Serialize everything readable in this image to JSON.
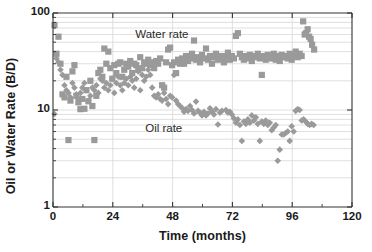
{
  "chart_data": {
    "type": "scatter",
    "title": "",
    "xlabel": "Time (months)",
    "ylabel": "Oil or Water Rate (B/D)",
    "xlim": [
      0,
      120
    ],
    "ylim": [
      1,
      100
    ],
    "yscale": "log",
    "xscale": "linear",
    "grid": "horizontal log-minor gridlines plus vertical major gridlines",
    "legend": "inline annotations inside plot area",
    "xticks": [
      0,
      24,
      48,
      72,
      96,
      120
    ],
    "xtick_labels": [
      "0",
      "24",
      "48",
      "72",
      "96",
      "120"
    ],
    "x_minor_ticks": [
      12,
      36,
      60,
      84,
      108
    ],
    "yticks": [
      1,
      10,
      100
    ],
    "ytick_labels": [
      "1",
      "10",
      "100"
    ],
    "y_minor_ticks": [
      2,
      3,
      4,
      5,
      6,
      7,
      8,
      9,
      20,
      30,
      40,
      50,
      60,
      70,
      80,
      90
    ],
    "annotations": [
      {
        "text": "Water rate",
        "x": 33,
        "y": 60
      },
      {
        "text": "Oil rate",
        "x": 37,
        "y": 6.4
      }
    ],
    "marker_color": "#9a9a9a",
    "axis_color": "#333333",
    "grid_color": "#d8d8d8",
    "series": [
      {
        "name": "Water rate",
        "marker": "square",
        "color": "#9a9a9a",
        "points": [
          [
            0.6,
            75
          ],
          [
            1.4,
            38
          ],
          [
            2.2,
            57
          ],
          [
            3.0,
            30
          ],
          [
            3.8,
            14.5
          ],
          [
            4.6,
            13.5
          ],
          [
            5.4,
            22
          ],
          [
            6.2,
            4.9
          ],
          [
            7.0,
            12.5
          ],
          [
            7.8,
            25
          ],
          [
            8.6,
            29
          ],
          [
            9.4,
            14
          ],
          [
            10.2,
            12
          ],
          [
            11.0,
            10.2
          ],
          [
            11.8,
            13
          ],
          [
            12.6,
            10.3
          ],
          [
            13.4,
            16
          ],
          [
            14.2,
            12.3
          ],
          [
            15.0,
            20
          ],
          [
            15.8,
            11
          ],
          [
            16.6,
            4.9
          ],
          [
            17.4,
            14
          ],
          [
            18.2,
            24
          ],
          [
            19.0,
            26
          ],
          [
            19.8,
            22
          ],
          [
            20.6,
            43
          ],
          [
            21.4,
            30
          ],
          [
            22.2,
            40
          ],
          [
            23.0,
            27
          ],
          [
            23.8,
            21
          ],
          [
            24.6,
            29
          ],
          [
            25.4,
            24
          ],
          [
            26.2,
            30
          ],
          [
            27.0,
            31
          ],
          [
            27.8,
            22
          ],
          [
            28.6,
            26
          ],
          [
            29.4,
            30
          ],
          [
            30.2,
            28
          ],
          [
            31.0,
            32
          ],
          [
            31.8,
            24
          ],
          [
            32.6,
            30
          ],
          [
            33.4,
            29
          ],
          [
            34.2,
            26
          ],
          [
            35.0,
            35
          ],
          [
            35.8,
            27
          ],
          [
            36.6,
            31
          ],
          [
            37.4,
            30
          ],
          [
            38.2,
            33
          ],
          [
            39.0,
            29
          ],
          [
            39.8,
            31
          ],
          [
            40.6,
            27
          ],
          [
            41.4,
            32
          ],
          [
            42.2,
            30
          ],
          [
            43.0,
            34
          ],
          [
            43.8,
            18
          ],
          [
            44.6,
            17
          ],
          [
            45.4,
            31
          ],
          [
            46.2,
            42
          ],
          [
            47.0,
            44
          ],
          [
            47.8,
            29
          ],
          [
            48.6,
            31
          ],
          [
            49.4,
            24
          ],
          [
            50.2,
            33
          ],
          [
            51.0,
            30
          ],
          [
            51.8,
            34
          ],
          [
            52.6,
            30
          ],
          [
            53.4,
            36
          ],
          [
            54.2,
            32
          ],
          [
            55.0,
            34
          ],
          [
            55.8,
            38
          ],
          [
            56.6,
            52
          ],
          [
            57.4,
            33
          ],
          [
            58.2,
            35
          ],
          [
            59.0,
            31
          ],
          [
            59.8,
            37
          ],
          [
            60.6,
            34
          ],
          [
            61.4,
            43
          ],
          [
            62.2,
            33
          ],
          [
            63.0,
            36
          ],
          [
            63.8,
            30
          ],
          [
            64.6,
            35
          ],
          [
            65.4,
            38
          ],
          [
            66.2,
            33
          ],
          [
            67.0,
            36
          ],
          [
            67.8,
            34
          ],
          [
            68.6,
            31
          ],
          [
            69.4,
            36
          ],
          [
            70.2,
            39
          ],
          [
            71.0,
            33
          ],
          [
            71.8,
            36
          ],
          [
            72.6,
            34
          ],
          [
            73.4,
            58
          ],
          [
            74.2,
            62
          ],
          [
            75.0,
            38
          ],
          [
            75.8,
            35
          ],
          [
            76.6,
            33
          ],
          [
            77.4,
            36
          ],
          [
            78.2,
            34
          ],
          [
            79.0,
            37
          ],
          [
            79.8,
            32
          ],
          [
            80.6,
            36
          ],
          [
            81.4,
            35
          ],
          [
            82.2,
            38
          ],
          [
            83.0,
            34
          ],
          [
            83.8,
            23
          ],
          [
            84.6,
            36
          ],
          [
            85.4,
            33
          ],
          [
            86.2,
            37
          ],
          [
            87.0,
            35
          ],
          [
            87.8,
            34
          ],
          [
            88.6,
            38
          ],
          [
            89.4,
            33
          ],
          [
            90.2,
            36
          ],
          [
            91.0,
            32
          ],
          [
            91.8,
            37
          ],
          [
            92.6,
            35
          ],
          [
            93.4,
            36
          ],
          [
            94.2,
            34
          ],
          [
            95.0,
            38
          ],
          [
            95.8,
            33
          ],
          [
            96.6,
            36
          ],
          [
            97.4,
            40
          ],
          [
            98.2,
            35
          ],
          [
            99.0,
            38
          ],
          [
            99.8,
            36
          ],
          [
            100.4,
            82
          ],
          [
            101.0,
            60
          ],
          [
            101.6,
            62
          ],
          [
            102.2,
            68
          ],
          [
            102.8,
            57
          ],
          [
            103.4,
            54
          ],
          [
            104.0,
            47
          ],
          [
            104.8,
            42
          ]
        ]
      },
      {
        "name": "Oil rate",
        "marker": "diamond",
        "color": "#9a9a9a",
        "points": [
          [
            0.6,
            9.1
          ],
          [
            1.4,
            34
          ],
          [
            2.2,
            31
          ],
          [
            3.0,
            26
          ],
          [
            3.8,
            23
          ],
          [
            4.6,
            18
          ],
          [
            5.4,
            16
          ],
          [
            6.2,
            15
          ],
          [
            7.0,
            13.5
          ],
          [
            7.8,
            19
          ],
          [
            8.6,
            17
          ],
          [
            9.4,
            14.5
          ],
          [
            10.2,
            13
          ],
          [
            11.0,
            15
          ],
          [
            11.8,
            17
          ],
          [
            12.6,
            19
          ],
          [
            13.4,
            16
          ],
          [
            14.2,
            12.5
          ],
          [
            15.0,
            14
          ],
          [
            15.8,
            17
          ],
          [
            16.6,
            16
          ],
          [
            17.4,
            18
          ],
          [
            18.2,
            15
          ],
          [
            19.0,
            21
          ],
          [
            19.8,
            20
          ],
          [
            20.6,
            17
          ],
          [
            21.4,
            19
          ],
          [
            22.2,
            16
          ],
          [
            23.0,
            18
          ],
          [
            23.8,
            21
          ],
          [
            24.6,
            15
          ],
          [
            25.4,
            19
          ],
          [
            26.2,
            22
          ],
          [
            27.0,
            18
          ],
          [
            27.8,
            16
          ],
          [
            28.6,
            19
          ],
          [
            29.4,
            21
          ],
          [
            30.2,
            18
          ],
          [
            31.0,
            22
          ],
          [
            31.8,
            20
          ],
          [
            32.6,
            17
          ],
          [
            33.4,
            21
          ],
          [
            34.2,
            25
          ],
          [
            35.0,
            16
          ],
          [
            35.8,
            23
          ],
          [
            36.6,
            20
          ],
          [
            37.4,
            22
          ],
          [
            38.2,
            26
          ],
          [
            39.0,
            23
          ],
          [
            39.8,
            17
          ],
          [
            40.6,
            14
          ],
          [
            41.4,
            13.5
          ],
          [
            42.2,
            14.5
          ],
          [
            43.0,
            13
          ],
          [
            43.8,
            12.5
          ],
          [
            44.6,
            15
          ],
          [
            45.4,
            13
          ],
          [
            46.2,
            11.5
          ],
          [
            47.0,
            14
          ],
          [
            47.8,
            13.5
          ],
          [
            48.6,
            23
          ],
          [
            49.4,
            12.5
          ],
          [
            50.2,
            11.5
          ],
          [
            51.0,
            11
          ],
          [
            51.8,
            10.5
          ],
          [
            52.6,
            9.6
          ],
          [
            53.4,
            10.2
          ],
          [
            54.2,
            9.8
          ],
          [
            55.0,
            11
          ],
          [
            55.8,
            10
          ],
          [
            56.6,
            9.2
          ],
          [
            57.4,
            12.2
          ],
          [
            58.2,
            9.8
          ],
          [
            59.0,
            9.4
          ],
          [
            59.8,
            8.8
          ],
          [
            60.6,
            9.6
          ],
          [
            61.4,
            8.8
          ],
          [
            62.2,
            9.2
          ],
          [
            63.0,
            10.4
          ],
          [
            63.8,
            9.6
          ],
          [
            64.6,
            9.0
          ],
          [
            65.4,
            10.2
          ],
          [
            66.2,
            7.1
          ],
          [
            67.0,
            9.4
          ],
          [
            67.8,
            9.8
          ],
          [
            68.6,
            34
          ],
          [
            69.4,
            10.0
          ],
          [
            70.2,
            9.4
          ],
          [
            71.0,
            9.6
          ],
          [
            71.8,
            9.0
          ],
          [
            72.6,
            8.2
          ],
          [
            73.4,
            7.4
          ],
          [
            74.2,
            8.0
          ],
          [
            75.0,
            7.0
          ],
          [
            75.8,
            4.8
          ],
          [
            76.6,
            7.6
          ],
          [
            77.4,
            7.2
          ],
          [
            78.2,
            8.0
          ],
          [
            79.0,
            7.4
          ],
          [
            79.8,
            8.8
          ],
          [
            80.6,
            7.8
          ],
          [
            81.4,
            8.4
          ],
          [
            82.2,
            7.2
          ],
          [
            83.0,
            4.8
          ],
          [
            83.8,
            7.6
          ],
          [
            84.6,
            7.2
          ],
          [
            85.4,
            7.8
          ],
          [
            86.2,
            7.0
          ],
          [
            87.0,
            7.4
          ],
          [
            87.8,
            6.2
          ],
          [
            88.6,
            6.6
          ],
          [
            89.4,
            7.0
          ],
          [
            90.2,
            3.0
          ],
          [
            91.0,
            3.9
          ],
          [
            91.8,
            5.6
          ],
          [
            92.6,
            5.6
          ],
          [
            93.4,
            5.8
          ],
          [
            94.2,
            6.0
          ],
          [
            95.0,
            4.8
          ],
          [
            95.8,
            6.8
          ],
          [
            96.6,
            6.0
          ],
          [
            97.4,
            9.8
          ],
          [
            98.2,
            10.2
          ],
          [
            99.0,
            10.0
          ],
          [
            99.8,
            7.8
          ],
          [
            100.6,
            8.0
          ],
          [
            101.4,
            7.6
          ],
          [
            102.2,
            7.2
          ],
          [
            103.0,
            7.0
          ],
          [
            103.8,
            7.2
          ],
          [
            104.6,
            7.0
          ]
        ]
      }
    ]
  }
}
